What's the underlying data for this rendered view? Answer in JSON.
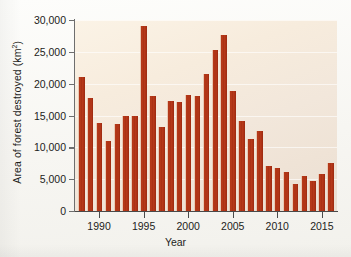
{
  "chart_data": {
    "type": "bar",
    "title": "",
    "xlabel": "Year",
    "ylabel": "Area of forest destroyed (km2)",
    "ylabel_base": "Area of forest destroyed (km",
    "ylabel_sup": "2",
    "ylabel_tail": ")",
    "xlim": [
      1987.3,
      2016.7
    ],
    "ylim": [
      0,
      30000
    ],
    "grid": true,
    "legend": null,
    "bar_color": "#b3381a",
    "plot_background": "#f4e9da",
    "categories": [
      1988,
      1989,
      1990,
      1991,
      1992,
      1993,
      1994,
      1995,
      1996,
      1997,
      1998,
      1999,
      2000,
      2001,
      2002,
      2003,
      2004,
      2005,
      2006,
      2007,
      2008,
      2009,
      2010,
      2011,
      2012,
      2013,
      2014,
      2015,
      2016
    ],
    "values": [
      21000,
      17700,
      13800,
      11000,
      13700,
      14900,
      14900,
      29000,
      18000,
      13200,
      17300,
      17100,
      18200,
      18000,
      21500,
      25300,
      27600,
      18900,
      14100,
      11300,
      12600,
      7100,
      6800,
      6200,
      4300,
      5500,
      4700,
      5800,
      7500
    ],
    "ytick_values": [
      0,
      5000,
      10000,
      15000,
      20000,
      25000,
      30000
    ],
    "ytick_labels": [
      "0",
      "5,000",
      "10,000",
      "15,000",
      "20,000",
      "25,000",
      "30,000"
    ],
    "xtick_values": [
      1990,
      1995,
      2000,
      2005,
      2010,
      2015
    ],
    "xtick_labels": [
      "1990",
      "1995",
      "2000",
      "2005",
      "2010",
      "2015"
    ]
  }
}
